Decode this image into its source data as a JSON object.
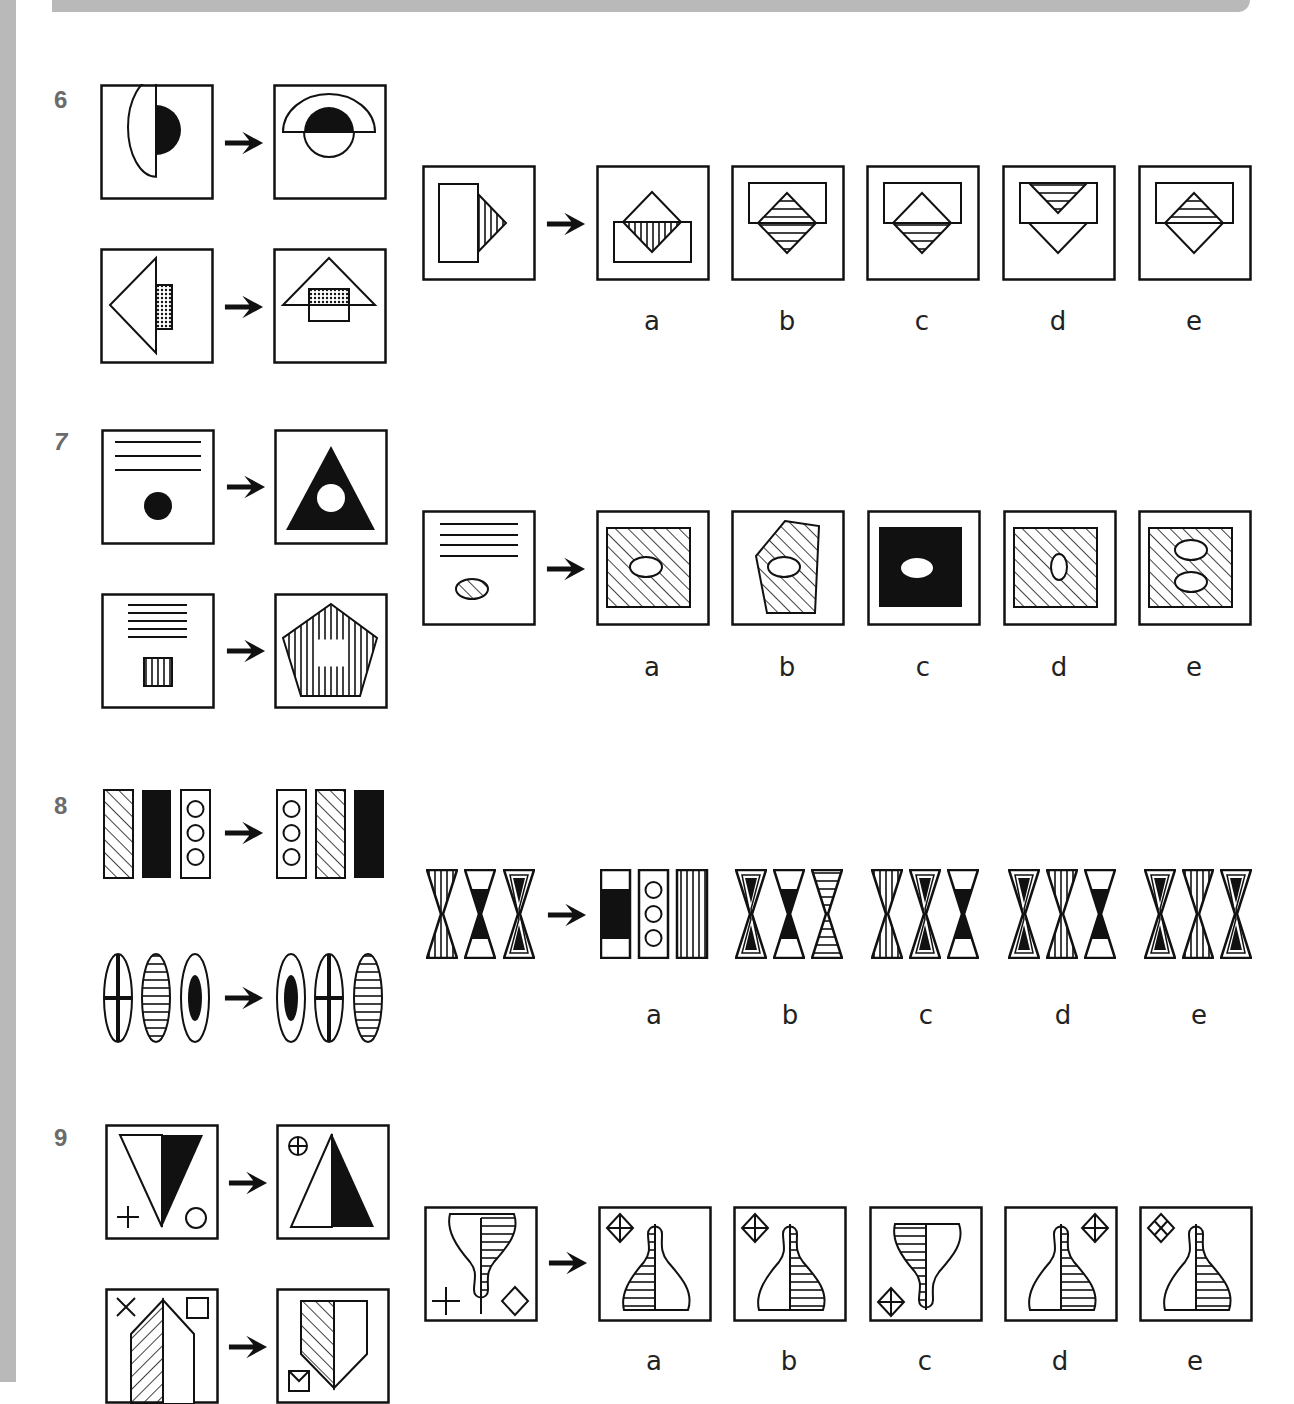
{
  "page": {
    "questions": [
      {
        "number": "6",
        "options": [
          "a",
          "b",
          "c",
          "d",
          "e"
        ]
      },
      {
        "number": "7",
        "options": [
          "a",
          "b",
          "c",
          "d",
          "e"
        ]
      },
      {
        "number": "8",
        "options": [
          "a",
          "b",
          "c",
          "d",
          "e"
        ]
      },
      {
        "number": "9",
        "options": [
          "a",
          "b",
          "c",
          "d",
          "e"
        ]
      }
    ]
  },
  "colors": {
    "strip": "#b9b9b9",
    "number": "#6b6b6b",
    "ink": "#111111"
  }
}
